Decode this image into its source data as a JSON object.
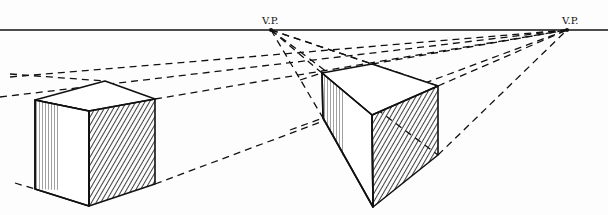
{
  "labels": {
    "vp_left": "V.P.",
    "vp_right": "V.P."
  },
  "horizon": {
    "y": 30,
    "x1": 0,
    "x2": 608
  },
  "vanishing_points": [
    {
      "name": "vp_left",
      "x": 271,
      "y": 30
    },
    {
      "name": "vp_right",
      "x": 567,
      "y": 30
    }
  ],
  "colors": {
    "ink": "#111111",
    "paper": "#fdfdfd"
  },
  "cubes": [
    {
      "name": "left-cube",
      "top_back": [
        105,
        81
      ],
      "top_left": [
        35,
        100
      ],
      "top_front": [
        89,
        111
      ],
      "top_right": [
        155,
        99
      ],
      "bottom_left": [
        35,
        189
      ],
      "bottom_front": [
        89,
        206
      ],
      "bottom_right": [
        155,
        184
      ]
    },
    {
      "name": "right-cube",
      "top_back": [
        372,
        64
      ],
      "top_left": [
        322,
        73
      ],
      "top_front": [
        372,
        115
      ],
      "top_right": [
        438,
        86
      ],
      "bottom_left": [
        323,
        118
      ],
      "bottom_front": [
        373,
        207
      ],
      "bottom_right": [
        438,
        155
      ]
    }
  ]
}
